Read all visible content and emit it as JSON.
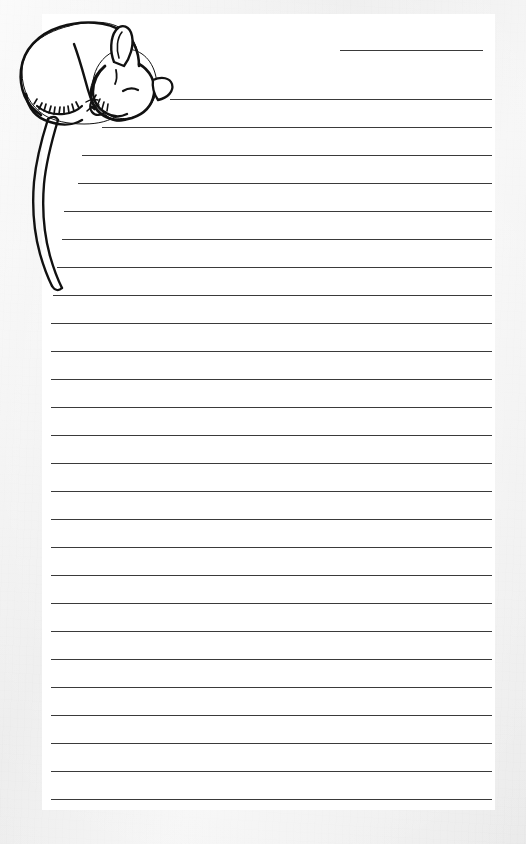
{
  "page": {
    "kind": "stationery-sheet",
    "orientation": "portrait",
    "width_px": 526,
    "height_px": 844,
    "background_color": "#eeeeee",
    "sheet_color": "#ffffff",
    "ink_color": "#111111",
    "rule_color": "#3a3a3a"
  },
  "sheet": {
    "left_px": 42,
    "top_px": 14,
    "width_px": 453,
    "height_px": 796
  },
  "date_rule": {
    "label": "date-line",
    "left_px": 340,
    "top_px": 50,
    "width_px": 143
  },
  "ruled_lines": {
    "count": 26,
    "first_top_px": 99,
    "spacing_px": 28,
    "right_edge_px": 492,
    "default_left_px": 51,
    "lines": [
      {
        "index": 1,
        "top_px": 99,
        "left_px": 170
      },
      {
        "index": 2,
        "top_px": 127,
        "left_px": 102
      },
      {
        "index": 3,
        "top_px": 155,
        "left_px": 82
      },
      {
        "index": 4,
        "top_px": 183,
        "left_px": 78
      },
      {
        "index": 5,
        "top_px": 211,
        "left_px": 64
      },
      {
        "index": 6,
        "top_px": 239,
        "left_px": 62
      },
      {
        "index": 7,
        "top_px": 267,
        "left_px": 57
      },
      {
        "index": 8,
        "top_px": 295,
        "left_px": 53
      },
      {
        "index": 9,
        "top_px": 323,
        "left_px": 51
      },
      {
        "index": 10,
        "top_px": 351,
        "left_px": 51
      },
      {
        "index": 11,
        "top_px": 379,
        "left_px": 51
      },
      {
        "index": 12,
        "top_px": 407,
        "left_px": 51
      },
      {
        "index": 13,
        "top_px": 435,
        "left_px": 51
      },
      {
        "index": 14,
        "top_px": 463,
        "left_px": 51
      },
      {
        "index": 15,
        "top_px": 491,
        "left_px": 51
      },
      {
        "index": 16,
        "top_px": 519,
        "left_px": 51
      },
      {
        "index": 17,
        "top_px": 547,
        "left_px": 51
      },
      {
        "index": 18,
        "top_px": 575,
        "left_px": 51
      },
      {
        "index": 19,
        "top_px": 603,
        "left_px": 51
      },
      {
        "index": 20,
        "top_px": 631,
        "left_px": 51
      },
      {
        "index": 21,
        "top_px": 659,
        "left_px": 51
      },
      {
        "index": 22,
        "top_px": 687,
        "left_px": 51
      },
      {
        "index": 23,
        "top_px": 715,
        "left_px": 51
      },
      {
        "index": 24,
        "top_px": 743,
        "left_px": 51
      },
      {
        "index": 25,
        "top_px": 771,
        "left_px": 51
      },
      {
        "index": 26,
        "top_px": 799,
        "left_px": 51
      }
    ]
  },
  "illustration": {
    "subject": "sleeping-mouse",
    "style": "black-ink-line-drawing",
    "description": "A mouse curled up asleep, head resting down over the top ruled line, long tail hanging down the left margin",
    "parts": [
      {
        "name": "body",
        "label": "curled body and haunch"
      },
      {
        "name": "head",
        "label": "head resting down"
      },
      {
        "name": "ear",
        "label": "ear"
      },
      {
        "name": "eye",
        "label": "closed eye"
      },
      {
        "name": "nose",
        "label": "nose"
      },
      {
        "name": "whiskers",
        "label": "whiskers"
      },
      {
        "name": "forepaw",
        "label": "tucked forepaw"
      },
      {
        "name": "hind-foot",
        "label": "hind foot"
      },
      {
        "name": "fur-texture",
        "label": "fur tufts on haunch"
      },
      {
        "name": "tail",
        "label": "long curving tail"
      }
    ]
  }
}
